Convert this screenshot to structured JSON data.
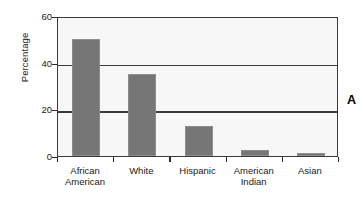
{
  "chart_data": {
    "type": "bar",
    "title": "",
    "subtitle": "",
    "xlabel": "",
    "ylabel": "Percentage",
    "categories": [
      "African\nAmerican",
      "White",
      "Hispanic",
      "American\nIndian",
      "Asian"
    ],
    "values": [
      50,
      35,
      13,
      2.5,
      1.2
    ],
    "ylim": [
      0,
      60
    ],
    "yticks": [
      0,
      20,
      40,
      60
    ],
    "ytick_labels": [
      "0",
      "20",
      "40",
      "60"
    ],
    "grid": "horizontal",
    "legend": null,
    "bar_color": "#767676",
    "plot_background": "#f7f7f7",
    "axis_color": "#3a3a3a",
    "annotations": [
      {
        "name": "panel-letter",
        "text": "A"
      }
    ]
  }
}
